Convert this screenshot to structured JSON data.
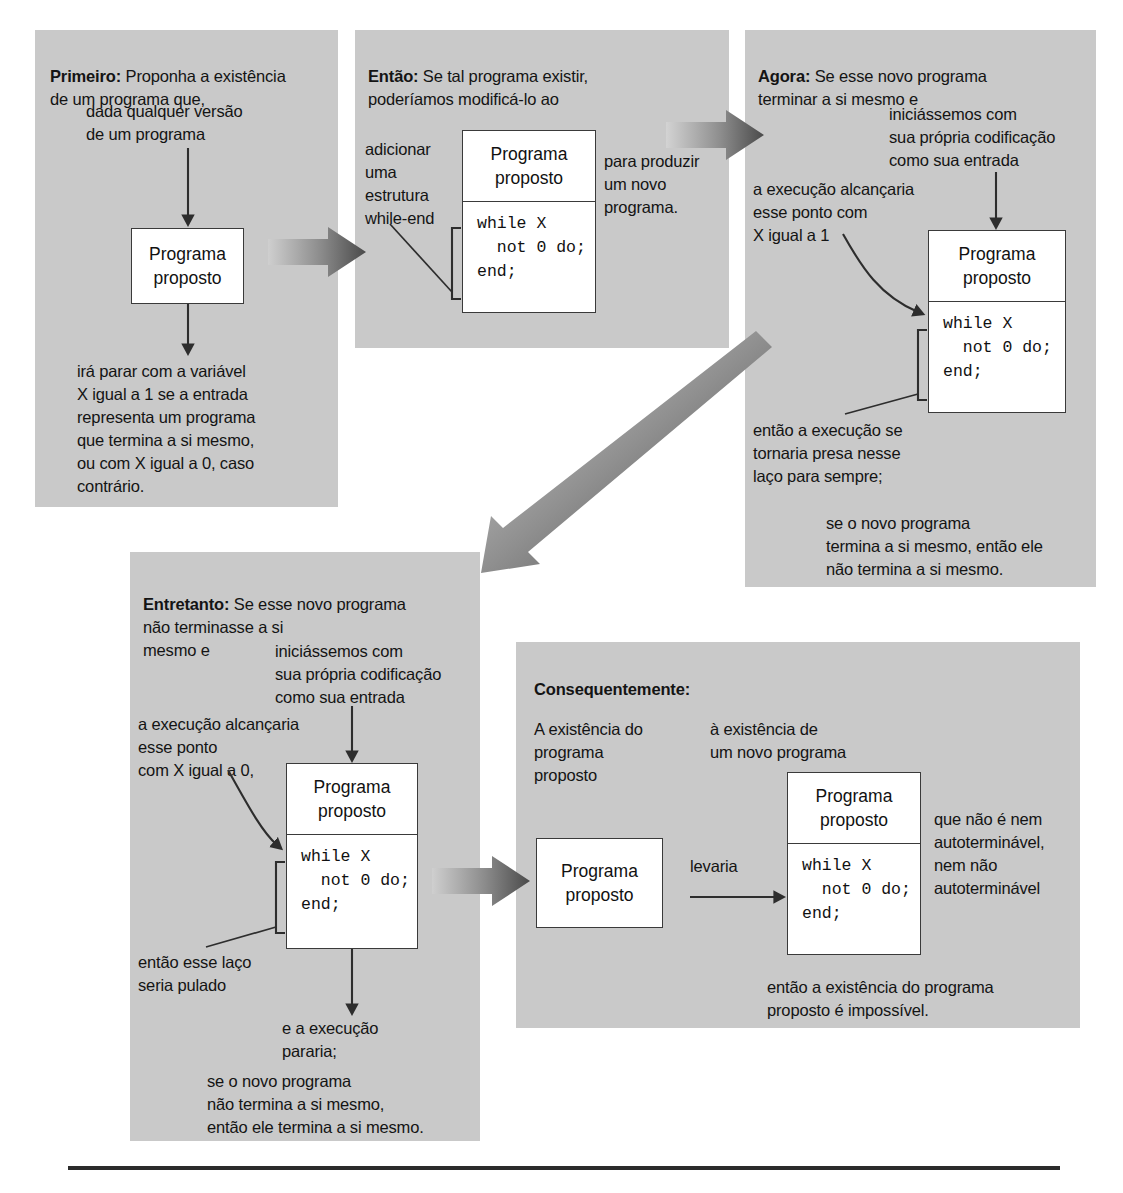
{
  "document": {
    "language": "pt-BR",
    "kind": "halting-problem-proof-diagram"
  },
  "program_box": {
    "title": "Programa\nproposto",
    "code": "while X\n  not 0 do;\nend;"
  },
  "panels": {
    "first": {
      "lead": "Primeiro:",
      "lead_text": " Proponha a existência\nde um programa que,",
      "note_top": "dada qualquer versão\nde um programa",
      "note_bottom": "irá parar com a variável\nX igual a 1 se a entrada\nrepresenta um programa\nque termina a si mesmo,\nou com X igual a 0, caso\ncontrário."
    },
    "then": {
      "lead": "Então:",
      "lead_text": " Se tal programa existir,\npoderíamos modificá-lo ao",
      "note_left": "adicionar\numa\nestrutura\nwhile-end",
      "note_right": "para produzir\num novo\nprograma."
    },
    "now": {
      "lead": "Agora:",
      "lead_text": " Se esse novo programa\nterminar a si mesmo e",
      "note_input": "iniciássemos com\nsua própria codificação\ncomo sua entrada",
      "note_exec": "a execução alcançaria\nesse ponto com\nX igual a 1",
      "note_loop": "então a execução se\ntornaria presa nesse\nlaço para sempre;",
      "note_concl": "se o novo programa\ntermina a si mesmo, então ele\nnão termina a si mesmo."
    },
    "however": {
      "lead": "Entretanto:",
      "lead_text": " Se esse novo programa\nnão terminasse a si\nmesmo e",
      "note_input": "iniciássemos com\nsua própria codificação\ncomo sua entrada",
      "note_exec": "a execução alcançaria\nesse ponto\ncom X igual a 0,",
      "note_skip": "então esse laço\nseria pulado",
      "note_stop": "e a execução\npararia;",
      "note_concl": "se o novo programa\nnão termina a si mesmo,\nentão ele termina a si mesmo."
    },
    "consequently": {
      "lead": "Consequentemente:",
      "note_existence": "A existência do\nprograma\nproposto",
      "note_leads": "levaria",
      "note_to": "à existência de\num novo programa",
      "note_neither": "que não é nem\nautoterminável,\nnem não\nautoterminável",
      "note_concl": "então a existência do programa\nproposto é impossível."
    }
  },
  "colors": {
    "panel_bg": "#c9c9c9",
    "box_bg": "#ffffff",
    "box_border": "#3a3a3a",
    "text": "#141414",
    "arrow_dark": "#3b3b3b",
    "arrow_light": "#b9b9b9",
    "rule": "#2b2b2b"
  }
}
